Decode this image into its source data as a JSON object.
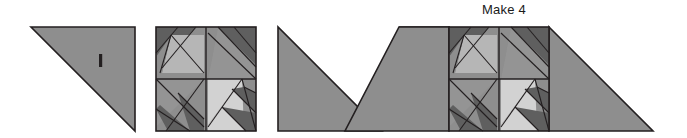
{
  "diagram": {
    "type": "quilt-block-assembly",
    "annotation": {
      "make_label": "Make 4"
    },
    "palette": {
      "background": "#ffffff",
      "outline": "#231f20",
      "medium_gray": "#8e8e8e",
      "medium_gray_alt": "#949494",
      "light_gray": "#b6b6b6",
      "lightest_gray": "#d2d2d2",
      "dark_gray": "#5f5f5f",
      "grain_mark": "#231f20"
    },
    "steps": [
      {
        "name": "setting-triangle-left",
        "shape": "right-triangle",
        "right_angle_corner": "bottom-right",
        "fill": "medium_gray",
        "has_grain_mark": true
      },
      {
        "name": "pinwheel-block",
        "shape": "four-patch-square",
        "quadrants": 4,
        "rotation_symmetry": "90-degree"
      },
      {
        "name": "setting-triangle-right",
        "shape": "right-triangle",
        "right_angle_corner": "bottom-left",
        "fill": "medium_gray",
        "has_grain_mark": false
      },
      {
        "name": "assembled-unit",
        "shape": "parallelogram-with-center-block",
        "label": "Make 4"
      }
    ]
  }
}
